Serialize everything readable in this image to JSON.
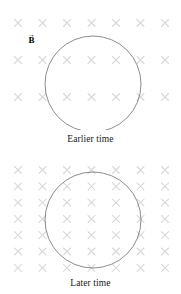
{
  "figure": {
    "title_semantic": "magnetic-flux-through-loop-over-time",
    "stroke_color": "#6e6e6e",
    "field_mark_color": "#d8d8d8",
    "background": "#ffffff"
  },
  "panels": [
    {
      "id": "earlier",
      "caption": "Earlier time",
      "field_label": {
        "arrow": "→",
        "symbol": "B",
        "meaning": "magnetic-field-vector-into-page"
      },
      "field": {
        "symbol": "×",
        "meaning": "field-into-page",
        "columns": 7,
        "rows": 4,
        "x_start": 18,
        "x_spacing": 24.5,
        "y_start": 23,
        "y_spacing": 37,
        "mark_size": 7,
        "count": 28
      },
      "loop": {
        "shape": "circle",
        "cx": 93,
        "cy": 84,
        "r": 48,
        "meaning": "conducting-loop"
      }
    },
    {
      "id": "later",
      "caption": "Later time",
      "field_label": {
        "arrow": "→",
        "symbol": "B",
        "meaning": "magnetic-field-vector-into-page"
      },
      "field": {
        "symbol": "×",
        "meaning": "field-into-page",
        "columns": 7,
        "rows": 7,
        "x_start": 18,
        "x_spacing": 24.5,
        "y_start": 18,
        "y_spacing": 16.3,
        "mark_size": 7,
        "count": 49
      },
      "loop": {
        "shape": "circle",
        "cx": 93,
        "cy": 68,
        "r": 48,
        "meaning": "conducting-loop"
      }
    }
  ],
  "chart_data": {
    "type": "diagram",
    "annotations": [
      "Earlier time",
      "Later time",
      "B"
    ],
    "series": [
      {
        "name": "Earlier time",
        "field_line_density_marks": 28,
        "loop_radius_px": 48,
        "field_rows": 4,
        "field_columns": 7
      },
      {
        "name": "Later time",
        "field_line_density_marks": 49,
        "loop_radius_px": 48,
        "field_rows": 7,
        "field_columns": 7
      }
    ]
  }
}
